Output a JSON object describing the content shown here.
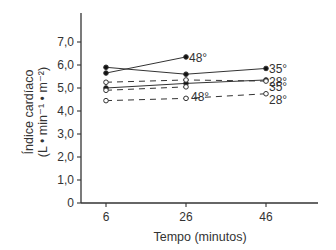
{
  "chart_data": {
    "type": "line",
    "title": "",
    "xlabel": "Tempo (minutos)",
    "ylabel_line1": "Índice cardíaco",
    "ylabel_line2": "(L • min⁻¹ • m⁻²)",
    "x": [
      6,
      26,
      46
    ],
    "x_tick_labels": [
      "6",
      "26",
      "46"
    ],
    "y_tick_labels": [
      "0",
      "1,0",
      "2,0",
      "3,0",
      "4,0",
      "5,0",
      "6,0",
      "7,0"
    ],
    "ylim": [
      0,
      8.2
    ],
    "grid": false,
    "series": [
      {
        "name": "35° (solid, filled)",
        "label": "35°",
        "style": "solid",
        "marker": "filled",
        "x": [
          6,
          26,
          46
        ],
        "values": [
          5.9,
          5.6,
          5.85
        ]
      },
      {
        "name": "48° (solid, filled)",
        "label": "48°",
        "style": "solid",
        "marker": "filled",
        "x": [
          6,
          26
        ],
        "values": [
          5.65,
          6.35
        ]
      },
      {
        "name": "28° (solid, filled)",
        "label": "28°",
        "style": "solid",
        "marker": "filled",
        "x": [
          6,
          26,
          46
        ],
        "values": [
          5.0,
          5.2,
          5.35
        ]
      },
      {
        "name": "35° (dashed, open)",
        "label": "35°",
        "style": "dashed",
        "marker": "open",
        "x": [
          6,
          26,
          46
        ],
        "values": [
          5.25,
          5.35,
          5.3
        ]
      },
      {
        "name": "48° (dashed, open)",
        "label": "48°",
        "style": "dashed",
        "marker": "open",
        "x": [
          6,
          26
        ],
        "values": [
          4.9,
          5.05
        ]
      },
      {
        "name": "28° (dashed, open)",
        "label": "28°",
        "style": "dashed",
        "marker": "open",
        "x": [
          6,
          26,
          46
        ],
        "values": [
          4.45,
          4.55,
          4.75
        ]
      }
    ]
  }
}
